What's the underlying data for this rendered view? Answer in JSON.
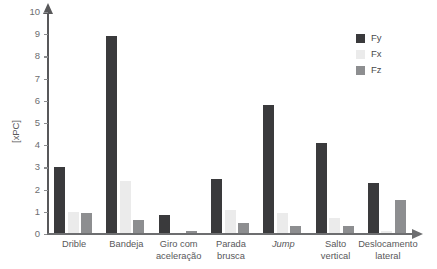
{
  "chart_data": {
    "type": "bar",
    "title": "",
    "xlabel": "",
    "ylabel": "[xPC]",
    "ylim": [
      0,
      10
    ],
    "yticks": [
      0,
      1,
      2,
      3,
      4,
      5,
      6,
      7,
      8,
      9,
      10
    ],
    "ytick_labels": [
      "0",
      "1",
      "2",
      "3",
      "4",
      "5",
      "6",
      "7",
      "8",
      "9",
      "10"
    ],
    "grid": false,
    "legend_position": "top-right",
    "categories": [
      "Drible",
      "Bandeja",
      "Giro com\naceleração",
      "Parada\nbrusca",
      "Jump",
      "Salto\nvertical",
      "Deslocamento\nlateral"
    ],
    "category_styles": [
      "normal",
      "normal",
      "normal",
      "normal",
      "italic",
      "normal",
      "normal"
    ],
    "series": [
      {
        "name": "Fy",
        "color": "#3a3a3c",
        "values": [
          3.0,
          8.9,
          0.85,
          2.5,
          5.8,
          4.1,
          2.3
        ]
      },
      {
        "name": "Fx",
        "color": "#ebebeb",
        "values": [
          1.0,
          2.4,
          0.05,
          1.1,
          0.95,
          0.7,
          0.15
        ]
      },
      {
        "name": "Fz",
        "color": "#8d8e90",
        "values": [
          0.95,
          0.65,
          0.15,
          0.5,
          0.35,
          0.35,
          1.55
        ]
      }
    ]
  },
  "axes": {
    "y_axis_title": "[xPC]",
    "y_tick_labels": [
      "10",
      "9",
      "8",
      "7",
      "6",
      "5",
      "4",
      "3",
      "2",
      "1",
      "0"
    ]
  },
  "legend": {
    "items": [
      {
        "label": "Fy",
        "color": "#3a3a3c"
      },
      {
        "label": "Fx",
        "color": "#ebebeb"
      },
      {
        "label": "Fz",
        "color": "#8d8e90"
      }
    ]
  }
}
